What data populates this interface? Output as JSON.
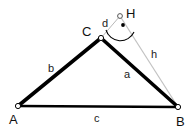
{
  "figure": {
    "background_color": "#ffffff",
    "stroke_color": "#000000",
    "thin_stroke_color": "#b8b8b8",
    "width": 194,
    "height": 129
  },
  "points": [
    {
      "name": "A",
      "label": "A",
      "x": 18,
      "y": 106,
      "label_x": 9,
      "label_y": 124,
      "marker": "open-circle"
    },
    {
      "name": "B",
      "label": "B",
      "x": 178,
      "y": 107,
      "label_x": 179,
      "label_y": 125,
      "marker": "open-circle"
    },
    {
      "name": "C",
      "label": "C",
      "x": 101,
      "y": 38,
      "label_x": 85,
      "label_y": 35,
      "marker": "open-circle"
    },
    {
      "name": "H",
      "label": "H",
      "x": 120,
      "y": 16,
      "label_x": 127,
      "label_y": 16,
      "marker": "open-circle"
    }
  ],
  "segments": [
    {
      "name": "side-b",
      "label": "b",
      "from": "A",
      "to": "C",
      "label_x": 50,
      "label_y": 71,
      "style": "thick",
      "color": "#000000"
    },
    {
      "name": "side-a",
      "label": "a",
      "from": "C",
      "to": "B",
      "label_x": 126,
      "label_y": 78,
      "style": "thick",
      "color": "#000000"
    },
    {
      "name": "side-c",
      "label": "c",
      "from": "A",
      "to": "B",
      "label_x": 96,
      "label_y": 121,
      "style": "medium",
      "color": "#000000"
    },
    {
      "name": "segment-h",
      "label": "h",
      "from": "H",
      "to": "B",
      "label_x": 153,
      "label_y": 57,
      "style": "thin",
      "color": "#b8b8b8"
    },
    {
      "name": "segment-d",
      "label": "d",
      "from": "C",
      "to": "H",
      "label_x": 104,
      "label_y": 25,
      "style": "thin",
      "color": "#b8b8b8"
    }
  ],
  "angle_marker": {
    "name": "angle-at-H",
    "vertex": "H",
    "center_dot_x": 123,
    "center_dot_y": 25,
    "arc_radius": 14,
    "color": "#000000"
  }
}
